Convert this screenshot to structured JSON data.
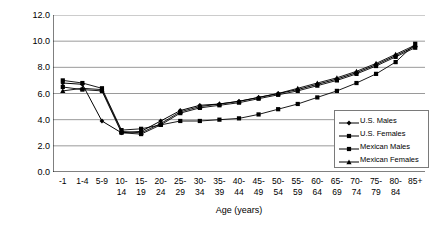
{
  "chart_data": {
    "type": "line",
    "title": "",
    "xlabel": "Age (years)",
    "ylabel": "Death Rate (per 100,000)",
    "ylim": [
      0.0,
      12.0
    ],
    "yticks": [
      "0.0",
      "2.0",
      "4.0",
      "6.0",
      "8.0",
      "10.0",
      "12.0"
    ],
    "ytick_values": [
      0.0,
      2.0,
      4.0,
      6.0,
      8.0,
      10.0,
      12.0
    ],
    "grid": "horizontal",
    "legend_position": "bottom-right",
    "categories": [
      "-1",
      "1-4",
      "5-9",
      "10-14",
      "15-19",
      "20-24",
      "25-29",
      "30-34",
      "35-39",
      "40-44",
      "45-49",
      "50-54",
      "55-59",
      "60-64",
      "65-69",
      "70-74",
      "75-79",
      "80-84",
      "85+"
    ],
    "category_lines": [
      [
        "-1",
        ""
      ],
      [
        "1-4",
        ""
      ],
      [
        "5-9",
        ""
      ],
      [
        "10-",
        "14"
      ],
      [
        "15-",
        "19"
      ],
      [
        "20-",
        "24"
      ],
      [
        "25-",
        "29"
      ],
      [
        "30-",
        "34"
      ],
      [
        "35-",
        "39"
      ],
      [
        "40-",
        "44"
      ],
      [
        "45-",
        "49"
      ],
      [
        "50-",
        "54"
      ],
      [
        "55-",
        "59"
      ],
      [
        "60-",
        "64"
      ],
      [
        "65-",
        "69"
      ],
      [
        "70-",
        "74"
      ],
      [
        "75-",
        "79"
      ],
      [
        "80-",
        "84"
      ],
      [
        "85+",
        ""
      ]
    ],
    "series": [
      {
        "name": "U.S. Males",
        "marker": "diamond",
        "values": [
          6.8,
          6.7,
          3.9,
          3.0,
          3.1,
          3.9,
          4.7,
          5.1,
          5.2,
          5.4,
          5.7,
          6.0,
          6.3,
          6.7,
          7.1,
          7.6,
          8.2,
          8.9,
          9.6
        ]
      },
      {
        "name": "U.S. Females",
        "marker": "square",
        "values": [
          7.0,
          6.8,
          6.4,
          3.2,
          3.3,
          3.6,
          3.9,
          3.9,
          4.0,
          4.1,
          4.4,
          4.8,
          5.2,
          5.7,
          6.2,
          6.8,
          7.5,
          8.4,
          9.8
        ]
      },
      {
        "name": "Mexican Males",
        "marker": "filled-square",
        "values": [
          6.5,
          6.3,
          6.2,
          3.0,
          2.9,
          3.6,
          4.5,
          4.9,
          5.1,
          5.3,
          5.6,
          5.9,
          6.2,
          6.6,
          7.0,
          7.5,
          8.1,
          8.8,
          9.5
        ]
      },
      {
        "name": "Mexican Females",
        "marker": "triangle",
        "values": [
          6.2,
          6.4,
          6.3,
          3.1,
          3.0,
          3.7,
          4.6,
          5.0,
          5.2,
          5.4,
          5.7,
          6.0,
          6.4,
          6.8,
          7.2,
          7.7,
          8.3,
          9.0,
          9.7
        ]
      }
    ],
    "colors": {
      "line": "#000000",
      "grid": "#808080",
      "axis": "#000000",
      "background": "#ffffff"
    }
  },
  "legend": {
    "items": [
      {
        "label": "U.S. Males"
      },
      {
        "label": "U.S. Females"
      },
      {
        "label": "Mexican Males"
      },
      {
        "label": "Mexican Females"
      }
    ]
  }
}
